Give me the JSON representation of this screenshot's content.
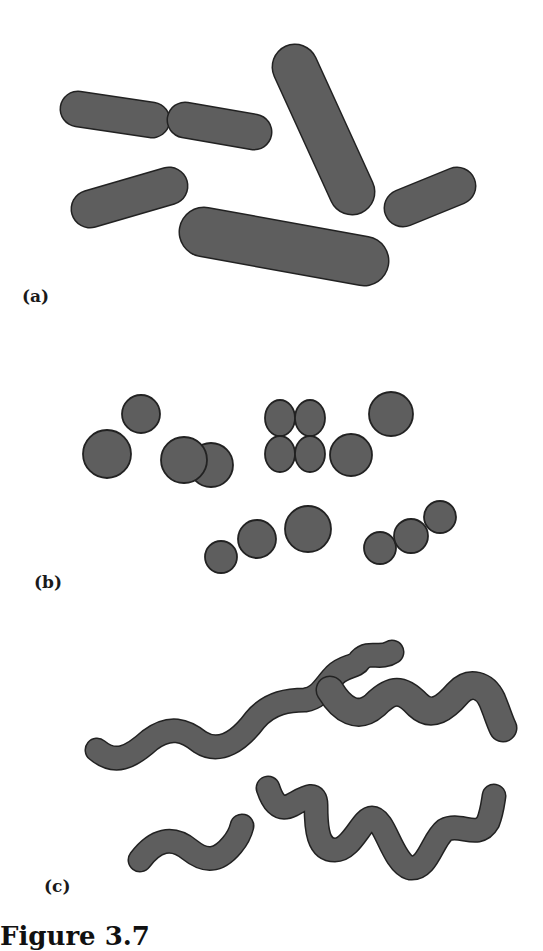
{
  "figure": {
    "type": "bacterial-morphology-illustration",
    "fill_color": "#5e5e5e",
    "stroke_color": "#222222",
    "background": "#ffffff",
    "panels": [
      {
        "id": "a",
        "label": "(a)",
        "label_pos": [
          22,
          300
        ],
        "shape_kind": "rods",
        "rods": [
          {
            "x1": 78,
            "y1": 109,
            "x2": 152,
            "y2": 120,
            "width": 34
          },
          {
            "x1": 185,
            "y1": 120,
            "x2": 254,
            "y2": 132,
            "width": 34
          },
          {
            "x1": 295,
            "y1": 67,
            "x2": 352,
            "y2": 192,
            "width": 44
          },
          {
            "x1": 90,
            "y1": 209,
            "x2": 169,
            "y2": 186,
            "width": 36
          },
          {
            "x1": 403,
            "y1": 208,
            "x2": 457,
            "y2": 186,
            "width": 36
          },
          {
            "x1": 204,
            "y1": 232,
            "x2": 364,
            "y2": 261,
            "width": 48
          }
        ]
      },
      {
        "id": "b",
        "label": "(b)",
        "label_pos": [
          34,
          586
        ],
        "shape_kind": "circles",
        "circles": [
          {
            "cx": 141,
            "cy": 414,
            "r": 19
          },
          {
            "cx": 107,
            "cy": 454,
            "r": 24
          },
          {
            "cx": 211,
            "cy": 465,
            "r": 22
          },
          {
            "cx": 184,
            "cy": 460,
            "r": 23
          },
          {
            "cx": 391,
            "cy": 414,
            "r": 22
          },
          {
            "cx": 351,
            "cy": 455,
            "r": 21
          },
          {
            "cx": 308,
            "cy": 529,
            "r": 23
          },
          {
            "cx": 257,
            "cy": 539,
            "r": 19
          },
          {
            "cx": 221,
            "cy": 557,
            "r": 16
          },
          {
            "cx": 380,
            "cy": 548,
            "r": 16
          },
          {
            "cx": 411,
            "cy": 536,
            "r": 17
          },
          {
            "cx": 440,
            "cy": 517,
            "r": 16
          }
        ],
        "tetrad": {
          "cx": 295,
          "cy": 436,
          "cell_rx": 15,
          "cell_ry": 18
        }
      },
      {
        "id": "c",
        "label": "(c)",
        "label_pos": [
          44,
          890
        ],
        "shape_kind": "spirals",
        "spirals": [
          {
            "d": "M 97 750 C 115 765, 130 758, 150 740 C 170 725, 185 730, 200 742 C 220 755, 240 740, 255 720 C 270 702, 290 700, 305 700 C 320 698, 325 685, 335 675 C 345 665, 355 668, 360 660 C 370 650, 380 660, 392 652",
            "width": 22
          },
          {
            "d": "M 330 690 C 342 710, 358 720, 375 705 C 392 688, 402 688, 418 705 C 432 718, 445 708, 458 693 C 470 680, 485 685, 492 700 C 497 712, 500 722, 503 728",
            "width": 26
          },
          {
            "d": "M 140 860 C 155 840, 172 835, 190 850 C 205 862, 218 862, 232 845 C 238 838, 240 834, 242 826",
            "width": 22
          },
          {
            "d": "M 268 788 C 272 800, 278 812, 292 805 C 305 798, 316 790, 316 805 C 316 830, 318 850, 335 850 C 352 850, 362 818, 372 818 C 385 818, 392 862, 410 868 C 428 870, 432 840, 445 830 C 460 822, 478 840, 488 822 C 492 812, 493 802, 494 796",
            "width": 22
          }
        ]
      }
    ]
  },
  "caption": {
    "visible_text": "Figure 3.7",
    "note": "caption truncated at bottom edge"
  }
}
